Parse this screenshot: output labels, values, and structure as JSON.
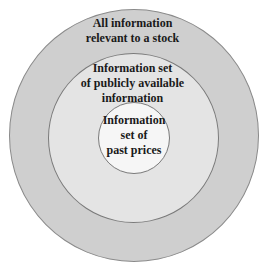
{
  "diagram": {
    "type": "nested-circles",
    "circles": [
      {
        "id": "outer",
        "lines": [
          "All information",
          "relevant to a stock"
        ],
        "fill": "#cfcfcf"
      },
      {
        "id": "middle",
        "lines": [
          "Information set",
          "of publicly available",
          "information"
        ],
        "fill": "#e4e4e4"
      },
      {
        "id": "inner",
        "lines": [
          "Information",
          "set of",
          "past prices"
        ],
        "fill": "#f6f6f6"
      }
    ]
  }
}
